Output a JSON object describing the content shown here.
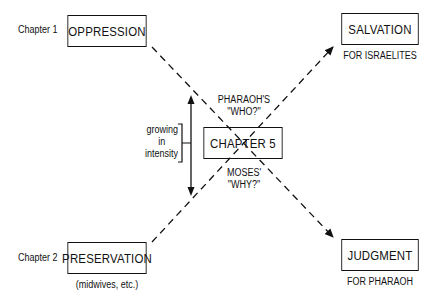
{
  "diagram": {
    "chapters": {
      "chapter1_label": "Chapter 1",
      "chapter2_label": "Chapter 2"
    },
    "boxes": {
      "oppression": "OPPRESSION",
      "preservation": "PRESERVATION",
      "chapter5": "CHAPTER 5",
      "salvation": "SALVATION",
      "judgment": "JUDGMENT"
    },
    "subtitles": {
      "preservation": "(midwives, etc.)",
      "salvation": "FOR ISRAELITES",
      "judgment": "FOR PHARAOH"
    },
    "center_labels": {
      "top_line1": "PHARAOH'S",
      "top_line2": "\"WHO?\"",
      "bottom_line1": "MOSES'",
      "bottom_line2": "\"WHY?\""
    },
    "intensity": {
      "line1": "growing",
      "line2": "in",
      "line3": "intensity"
    },
    "colors": {
      "ink": "#111111",
      "background": "#ffffff"
    }
  }
}
